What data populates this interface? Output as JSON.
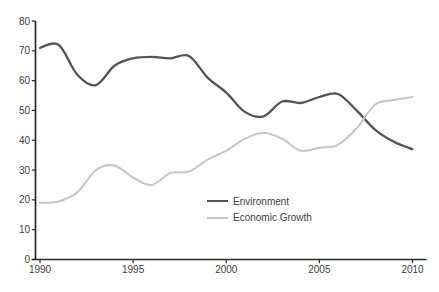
{
  "chart_data": {
    "type": "line",
    "title": "",
    "xlabel": "",
    "ylabel": "",
    "x": [
      1990,
      1991,
      1992,
      1993,
      1994,
      1995,
      1996,
      1997,
      1998,
      1999,
      2000,
      2001,
      2002,
      2003,
      2004,
      2005,
      2006,
      2007,
      2008,
      2009,
      2010
    ],
    "series": [
      {
        "name": "Environment",
        "color": "#545454",
        "line_width": 2.3,
        "values": [
          71,
          72,
          62,
          58.5,
          65,
          67.5,
          68,
          67.5,
          68.3,
          61,
          56,
          49.5,
          48,
          53,
          52.5,
          54.5,
          55.5,
          50,
          43.5,
          39.5,
          37
        ]
      },
      {
        "name": "Economic Growth",
        "color": "#c8c8c8",
        "line_width": 2.1,
        "values": [
          19,
          19.5,
          22.5,
          30,
          31.5,
          27.5,
          25,
          29,
          29.5,
          33.5,
          36.5,
          40.5,
          42.5,
          40.5,
          36.5,
          37.5,
          38.5,
          44,
          52,
          53.5,
          54.5
        ]
      }
    ],
    "xlim": [
      1990,
      2010
    ],
    "ylim": [
      0,
      80
    ],
    "x_ticks": [
      1990,
      1995,
      2000,
      2005,
      2010
    ],
    "y_ticks": [
      0,
      10,
      20,
      30,
      40,
      50,
      60,
      70,
      80
    ],
    "grid": false,
    "smooth": true,
    "legend_position": "inside-right-middle",
    "style": {
      "axis_color": "#2a2a2a",
      "tick_label_color": "#3d3d3d",
      "background": "#ffffff"
    }
  }
}
